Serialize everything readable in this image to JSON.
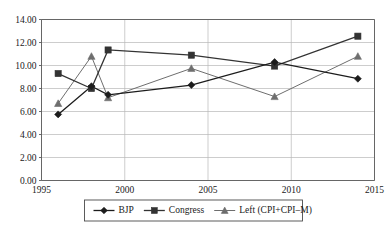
{
  "chart_data": {
    "type": "line",
    "title": "",
    "xlabel": "",
    "ylabel": "",
    "xlim": [
      1995,
      2015
    ],
    "ylim": [
      0.0,
      14.0
    ],
    "x": [
      1996,
      1998,
      1999,
      2004,
      2009,
      2014
    ],
    "xticks": [
      "1995",
      "2000",
      "2005",
      "2010",
      "2015"
    ],
    "xtick_values": [
      1995,
      2000,
      2005,
      2010,
      2015
    ],
    "yticks": [
      "0.00",
      "2.00",
      "4.00",
      "6.00",
      "8.00",
      "10.00",
      "12.00",
      "14.00"
    ],
    "ytick_values": [
      0.0,
      2.0,
      4.0,
      6.0,
      8.0,
      10.0,
      12.0,
      14.0
    ],
    "grid": true,
    "legend_position": "bottom",
    "series": [
      {
        "name": "BJP",
        "marker": "diamond",
        "color": "#1c1c1c",
        "values": [
          5.75,
          8.2,
          7.45,
          8.3,
          10.3,
          8.85
        ]
      },
      {
        "name": "Congress",
        "marker": "square",
        "color": "#333333",
        "values": [
          9.3,
          8.0,
          11.35,
          10.9,
          9.95,
          12.55
        ]
      },
      {
        "name": "Left (CPI+CPI–M)",
        "marker": "triangle",
        "color": "#6e6e6e",
        "values": [
          6.7,
          10.8,
          7.2,
          9.75,
          7.3,
          10.8
        ]
      }
    ]
  },
  "legend": {
    "items": [
      {
        "label": "BJP"
      },
      {
        "label": "Congress"
      },
      {
        "label": "Left (CPI+CPI–M)"
      }
    ]
  }
}
